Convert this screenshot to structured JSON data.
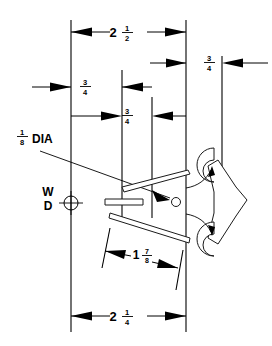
{
  "drawing": {
    "title": "Broadhead Arrowhead Dimensioned Detail",
    "background_color": "#ffffff",
    "line_color": "#000000",
    "width_px": 272,
    "height_px": 346
  },
  "dimensions": [
    {
      "id": "top-overall",
      "label": "2 1/2",
      "whole": "2",
      "numerator": "1",
      "denominator": "2",
      "position": "top",
      "unit": "in"
    },
    {
      "id": "bottom-overall",
      "label": "2 1/4",
      "whole": "2",
      "numerator": "1",
      "denominator": "4",
      "position": "bottom",
      "unit": "in"
    },
    {
      "id": "angled-width",
      "label": "1 7/8",
      "whole": "1",
      "numerator": "7",
      "denominator": "8",
      "position": "lower-center",
      "unit": "in"
    },
    {
      "id": "left-spacing",
      "label": "3/4",
      "whole": "",
      "numerator": "3",
      "denominator": "4",
      "position": "left-middle",
      "unit": "in"
    },
    {
      "id": "center-spacing",
      "label": "3/4",
      "whole": "",
      "numerator": "3",
      "denominator": "4",
      "position": "center-middle",
      "unit": "in"
    },
    {
      "id": "right-spacing",
      "label": "3/4",
      "whole": "",
      "numerator": "3",
      "denominator": "4",
      "position": "right-upper",
      "unit": "in"
    }
  ],
  "callouts": [
    {
      "id": "dia-callout",
      "whole": "",
      "numerator": "1",
      "denominator": "8",
      "text": "DIA",
      "full_label": "1/8 DIA",
      "points_to": "center-hole"
    },
    {
      "id": "wd-marker",
      "line1": "W",
      "line2": "D",
      "symbol": "crosshair-circle"
    }
  ]
}
